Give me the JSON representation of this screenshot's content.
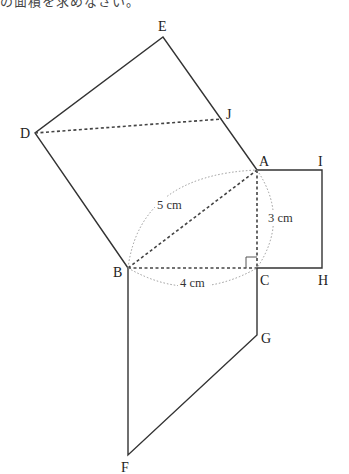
{
  "header": {
    "cut_off_text": "の面積を求めなさい。"
  },
  "diagram": {
    "type": "pythagorean-squares-figure",
    "vertices": {
      "A": {
        "label": "A",
        "x": 257,
        "y": 170
      },
      "B": {
        "label": "B",
        "x": 128,
        "y": 268
      },
      "C": {
        "label": "C",
        "x": 257,
        "y": 268
      },
      "D": {
        "label": "D",
        "x": 35,
        "y": 133
      },
      "E": {
        "label": "E",
        "x": 163,
        "y": 37
      },
      "F": {
        "label": "F",
        "x": 128,
        "y": 455
      },
      "G": {
        "label": "G",
        "x": 257,
        "y": 335
      },
      "H": {
        "label": "H",
        "x": 322,
        "y": 268
      },
      "I": {
        "label": "I",
        "x": 322,
        "y": 170
      },
      "J": {
        "label": "J",
        "x": 222,
        "y": 119
      }
    },
    "measurements": {
      "AB": "5 cm",
      "AC": "3 cm",
      "BC": "4 cm"
    },
    "right_angle_at": "C",
    "colors": {
      "line": "#333333",
      "dashed": "#444444",
      "dotted_arc": "#999999"
    }
  }
}
